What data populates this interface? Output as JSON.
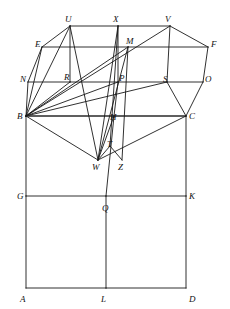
{
  "figure": {
    "width": 230,
    "height": 309,
    "background_color": "#ffffff",
    "stroke_color": "#1a1a1a",
    "stroke_width": 0.9,
    "label_color": "#111111"
  },
  "points": [
    {
      "id": "U",
      "label": "U",
      "x": 70,
      "y": 26,
      "label_x": 65,
      "label_y": 15
    },
    {
      "id": "X",
      "label": "X",
      "x": 118,
      "y": 26,
      "label_x": 113,
      "label_y": 15
    },
    {
      "id": "V",
      "label": "V",
      "x": 170,
      "y": 26,
      "label_x": 165,
      "label_y": 15
    },
    {
      "id": "E",
      "label": "E",
      "x": 42,
      "y": 47,
      "label_x": 35,
      "label_y": 40
    },
    {
      "id": "M",
      "label": "M",
      "x": 128,
      "y": 47,
      "label_x": 126,
      "label_y": 37
    },
    {
      "id": "F",
      "label": "F",
      "x": 208,
      "y": 47,
      "label_x": 211,
      "label_y": 40
    },
    {
      "id": "N",
      "label": "N",
      "x": 28,
      "y": 82,
      "label_x": 20,
      "label_y": 75
    },
    {
      "id": "R",
      "label": "R",
      "x": 70,
      "y": 82,
      "label_x": 64,
      "label_y": 73
    },
    {
      "id": "P",
      "label": "P",
      "x": 118,
      "y": 82,
      "label_x": 119,
      "label_y": 74
    },
    {
      "id": "S",
      "label": "S",
      "x": 167,
      "y": 82,
      "label_x": 163,
      "label_y": 75
    },
    {
      "id": "O",
      "label": "O",
      "x": 203,
      "y": 82,
      "label_x": 205,
      "label_y": 75
    },
    {
      "id": "B",
      "label": "B",
      "x": 26,
      "y": 116,
      "label_x": 17,
      "label_y": 112
    },
    {
      "id": "H",
      "label": "H",
      "x": 114,
      "y": 116,
      "label_x": 110,
      "label_y": 113
    },
    {
      "id": "C",
      "label": "C",
      "x": 186,
      "y": 116,
      "label_x": 189,
      "label_y": 112
    },
    {
      "id": "T",
      "label": "T",
      "x": 110,
      "y": 146,
      "label_x": 107,
      "label_y": 140
    },
    {
      "id": "W",
      "label": "W",
      "x": 98,
      "y": 160,
      "label_x": 92,
      "label_y": 163
    },
    {
      "id": "Z",
      "label": "Z",
      "x": 122,
      "y": 160,
      "label_x": 118,
      "label_y": 163
    },
    {
      "id": "G",
      "label": "G",
      "x": 26,
      "y": 196,
      "label_x": 17,
      "label_y": 192
    },
    {
      "id": "Q",
      "label": "Q",
      "x": 106,
      "y": 196,
      "label_x": 102,
      "label_y": 204
    },
    {
      "id": "K",
      "label": "K",
      "x": 186,
      "y": 196,
      "label_x": 189,
      "label_y": 192
    },
    {
      "id": "A",
      "label": "A",
      "x": 26,
      "y": 288,
      "label_x": 20,
      "label_y": 295
    },
    {
      "id": "L",
      "label": "L",
      "x": 106,
      "y": 288,
      "label_x": 101,
      "label_y": 295
    },
    {
      "id": "D",
      "label": "D",
      "x": 186,
      "y": 288,
      "label_x": 189,
      "label_y": 295
    }
  ],
  "segments": [
    {
      "from": "U",
      "to": "X",
      "name": "segment-U-X"
    },
    {
      "from": "X",
      "to": "V",
      "name": "segment-X-V"
    },
    {
      "from": "E",
      "to": "M",
      "name": "segment-E-M"
    },
    {
      "from": "M",
      "to": "F",
      "name": "segment-M-F"
    },
    {
      "from": "N",
      "to": "R",
      "name": "segment-N-R"
    },
    {
      "from": "R",
      "to": "P",
      "name": "segment-R-P"
    },
    {
      "from": "P",
      "to": "S",
      "name": "segment-P-S"
    },
    {
      "from": "S",
      "to": "O",
      "name": "segment-S-O"
    },
    {
      "from": "B",
      "to": "H",
      "name": "segment-B-H"
    },
    {
      "from": "H",
      "to": "C",
      "name": "segment-H-C"
    },
    {
      "from": "G",
      "to": "Q",
      "name": "segment-G-Q"
    },
    {
      "from": "Q",
      "to": "K",
      "name": "segment-Q-K"
    },
    {
      "from": "A",
      "to": "L",
      "name": "segment-A-L"
    },
    {
      "from": "L",
      "to": "D",
      "name": "segment-L-D"
    },
    {
      "from": "U",
      "to": "E",
      "name": "segment-U-E"
    },
    {
      "from": "E",
      "to": "N",
      "name": "segment-E-N"
    },
    {
      "from": "U",
      "to": "R",
      "name": "segment-U-R"
    },
    {
      "from": "X",
      "to": "P",
      "name": "segment-X-P"
    },
    {
      "from": "V",
      "to": "S",
      "name": "segment-V-S"
    },
    {
      "from": "V",
      "to": "F",
      "name": "segment-V-F"
    },
    {
      "from": "F",
      "to": "O",
      "name": "segment-F-O"
    },
    {
      "from": "O",
      "to": "C",
      "name": "segment-O-C"
    },
    {
      "from": "S",
      "to": "C",
      "name": "segment-S-C"
    },
    {
      "from": "N",
      "to": "B",
      "name": "segment-N-B"
    },
    {
      "from": "B",
      "to": "G",
      "name": "segment-B-G"
    },
    {
      "from": "G",
      "to": "A",
      "name": "segment-G-A"
    },
    {
      "from": "C",
      "to": "K",
      "name": "segment-C-K"
    },
    {
      "from": "K",
      "to": "D",
      "name": "segment-K-D"
    },
    {
      "from": "Q",
      "to": "L",
      "name": "segment-Q-L"
    },
    {
      "from": "B",
      "to": "U",
      "name": "segment-B-U"
    },
    {
      "from": "B",
      "to": "E",
      "name": "segment-B-E"
    },
    {
      "from": "B",
      "to": "R",
      "name": "segment-B-R"
    },
    {
      "from": "B",
      "to": "M",
      "name": "segment-B-M"
    },
    {
      "from": "B",
      "to": "P",
      "name": "segment-B-P"
    },
    {
      "from": "B",
      "to": "V",
      "name": "segment-B-V"
    },
    {
      "from": "B",
      "to": "S",
      "name": "segment-B-S"
    },
    {
      "from": "B",
      "to": "W",
      "name": "segment-B-W"
    },
    {
      "from": "B",
      "to": "C",
      "name": "segment-B-C"
    },
    {
      "from": "U",
      "to": "W",
      "name": "segment-U-W"
    },
    {
      "from": "X",
      "to": "W",
      "name": "segment-X-W"
    },
    {
      "from": "X",
      "to": "T",
      "name": "segment-X-T"
    },
    {
      "from": "M",
      "to": "W",
      "name": "segment-M-W"
    },
    {
      "from": "M",
      "to": "Z",
      "name": "segment-M-Z"
    },
    {
      "from": "W",
      "to": "T",
      "name": "segment-W-T"
    },
    {
      "from": "T",
      "to": "Z",
      "name": "segment-T-Z"
    },
    {
      "from": "W",
      "to": "C",
      "name": "segment-W-C"
    },
    {
      "from": "H",
      "to": "W",
      "name": "segment-H-W"
    },
    {
      "from": "P",
      "to": "H",
      "name": "segment-P-H"
    },
    {
      "from": "Q",
      "to": "H",
      "name": "segment-Q-H"
    }
  ]
}
